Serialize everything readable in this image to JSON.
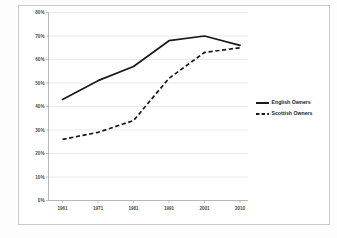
{
  "chart_data": {
    "type": "line",
    "title": "",
    "xlabel": "",
    "ylabel": "",
    "x": [
      "1961",
      "1971",
      "1981",
      "1991",
      "2001",
      "2010"
    ],
    "categories": [
      "1961",
      "1971",
      "1981",
      "1991",
      "2001",
      "2010"
    ],
    "series": [
      {
        "name": "English Owners",
        "style": "solid",
        "color": "#1a1a1a",
        "values": [
          43,
          51,
          57,
          68,
          70,
          66
        ]
      },
      {
        "name": "Scottish Owners",
        "style": "dashed",
        "color": "#1a1a1a",
        "values": [
          26,
          29,
          34,
          52,
          63,
          65
        ]
      }
    ],
    "ylim": [
      0,
      80
    ],
    "ytick_labels": [
      "0%",
      "10%",
      "20%",
      "30%",
      "40%",
      "50%",
      "60%",
      "70%",
      "80%"
    ],
    "ytick_values": [
      0,
      10,
      20,
      30,
      40,
      50,
      60,
      70,
      80
    ],
    "xtick_labels": [
      "1961",
      "1971",
      "1981",
      "1991",
      "2001",
      "2010"
    ],
    "grid": true,
    "legend_position": "right"
  },
  "legend": {
    "entries": [
      {
        "label": "English Owners"
      },
      {
        "label": "Scottish Owners"
      }
    ]
  },
  "colors": {
    "line": "#1a1a1a",
    "grid": "#d2d2d2",
    "axis": "#9a9a9a",
    "frame": "#c9c9c9",
    "label": "#4a4a4a"
  }
}
